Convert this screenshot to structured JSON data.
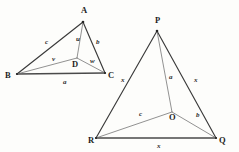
{
  "figure": {
    "title": "",
    "background_color": "#fdfdfb",
    "stroke_color": "#3a3a3a",
    "inner_stroke_color": "#6d6d6d",
    "label_color": "#1d1d1d"
  },
  "left_triangle": {
    "name": "triangle-abc",
    "vertices": [
      {
        "id": "A",
        "label": "A",
        "x": 83,
        "y": 22,
        "label_x": 81,
        "label_y": 13
      },
      {
        "id": "B",
        "label": "B",
        "x": 17,
        "y": 74,
        "label_x": 5,
        "label_y": 78
      },
      {
        "id": "C",
        "label": "C",
        "x": 105,
        "y": 73,
        "label_x": 108,
        "label_y": 78
      }
    ],
    "interior_point": {
      "id": "D",
      "label": "D",
      "x": 77,
      "y": 58,
      "label_x": 72,
      "label_y": 67
    },
    "outer_edges": [
      {
        "id": "AB",
        "from": "A",
        "to": "B"
      },
      {
        "id": "AC",
        "from": "A",
        "to": "C"
      }
    ],
    "base_edge": {
      "id": "BC",
      "from": "B",
      "to": "C"
    },
    "inner_edges": [
      {
        "id": "AD",
        "from": "A",
        "to": "D"
      },
      {
        "id": "BD",
        "from": "B",
        "to": "D"
      },
      {
        "id": "DC",
        "from": "D",
        "to": "C"
      }
    ],
    "side_labels": [
      {
        "id": "c",
        "label": "c",
        "edge": "AB",
        "x": 45,
        "y": 44
      },
      {
        "id": "u",
        "label": "u",
        "edge": "AD",
        "x": 76,
        "y": 41
      },
      {
        "id": "b",
        "label": "b",
        "edge": "AC",
        "x": 96,
        "y": 44
      },
      {
        "id": "v",
        "label": "v",
        "edge": "BD",
        "x": 52,
        "y": 61
      },
      {
        "id": "w",
        "label": "w",
        "edge": "DC",
        "x": 90,
        "y": 63
      },
      {
        "id": "a",
        "label": "a",
        "edge": "BC",
        "x": 63,
        "y": 84
      }
    ]
  },
  "right_triangle": {
    "name": "triangle-pqr",
    "vertices": [
      {
        "id": "P",
        "label": "P",
        "x": 157,
        "y": 31,
        "label_x": 155,
        "label_y": 23
      },
      {
        "id": "R",
        "label": "R",
        "x": 96,
        "y": 138,
        "label_x": 88,
        "label_y": 143
      },
      {
        "id": "Q",
        "label": "Q",
        "x": 216,
        "y": 138,
        "label_x": 219,
        "label_y": 143
      }
    ],
    "interior_point": {
      "id": "O",
      "label": "O",
      "x": 172,
      "y": 112,
      "label_x": 169,
      "label_y": 120
    },
    "outer_edges": [
      {
        "id": "PR",
        "from": "P",
        "to": "R"
      },
      {
        "id": "PQ",
        "from": "P",
        "to": "Q"
      }
    ],
    "base_edge": {
      "id": "RQ",
      "from": "R",
      "to": "Q"
    },
    "inner_edges": [
      {
        "id": "PO",
        "from": "P",
        "to": "O"
      },
      {
        "id": "RO",
        "from": "R",
        "to": "O"
      },
      {
        "id": "OQ",
        "from": "O",
        "to": "Q"
      }
    ],
    "side_labels": [
      {
        "id": "x-left",
        "label": "x",
        "edge": "PR",
        "x": 121,
        "y": 82
      },
      {
        "id": "a",
        "label": "a",
        "edge": "PO",
        "x": 169,
        "y": 79
      },
      {
        "id": "x-right",
        "label": "x",
        "edge": "PQ",
        "x": 194,
        "y": 82
      },
      {
        "id": "c",
        "label": "c",
        "edge": "RO",
        "x": 139,
        "y": 116
      },
      {
        "id": "b",
        "label": "b",
        "edge": "OQ",
        "x": 196,
        "y": 117
      },
      {
        "id": "x-base",
        "label": "x",
        "edge": "RQ",
        "x": 157,
        "y": 148
      }
    ]
  }
}
